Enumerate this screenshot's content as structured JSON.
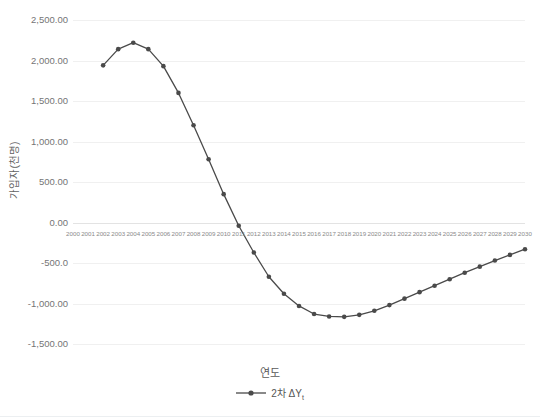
{
  "chart_data": {
    "type": "line",
    "title": "",
    "xlabel": "연도",
    "ylabel": "가입자(천명)",
    "x": [
      2000,
      2001,
      2002,
      2003,
      2004,
      2005,
      2006,
      2007,
      2008,
      2009,
      2010,
      2011,
      2012,
      2013,
      2014,
      2015,
      2016,
      2017,
      2018,
      2019,
      2020,
      2021,
      2022,
      2023,
      2024,
      2025,
      2026,
      2027,
      2028,
      2029,
      2030
    ],
    "xtick_labels": [
      "2000",
      "2001",
      "2002",
      "2003",
      "2004",
      "2005",
      "2006",
      "2007",
      "2008",
      "2009",
      "2010",
      "2011",
      "2012",
      "2013",
      "2014",
      "2015",
      "2016",
      "2017",
      "2018",
      "2019",
      "2020",
      "2021",
      "2022",
      "2023",
      "2024",
      "2025",
      "2026",
      "2027",
      "2028",
      "2029",
      "2030"
    ],
    "ytick_labels": [
      "2,500.00",
      "2,000.00",
      "1,500.00",
      "1,000.00",
      "500.00",
      "0.00",
      "-500.0",
      "-1,000.00",
      "-1,500.00"
    ],
    "ytick_values": [
      2500,
      2000,
      1500,
      1000,
      500,
      0,
      -500,
      -1000,
      -1500
    ],
    "ylim": [
      -1500,
      2500
    ],
    "xlim": [
      2000,
      2030
    ],
    "grid": true,
    "legend_position": "bottom",
    "series": [
      {
        "name": "2차 ΔY",
        "name_subscript": "t",
        "color": "#4a4a4a",
        "marker": "circle",
        "values": [
          null,
          null,
          1940,
          2140,
          2220,
          2140,
          1930,
          1600,
          1200,
          780,
          350,
          -40,
          -370,
          -670,
          -880,
          -1030,
          -1130,
          -1160,
          -1165,
          -1140,
          -1090,
          -1020,
          -940,
          -860,
          -780,
          -700,
          -620,
          -545,
          -470,
          -400,
          -330
        ]
      }
    ]
  },
  "axis": {
    "y_title": "가입자(천명)",
    "x_title": "연도"
  },
  "legend": {
    "items": [
      {
        "label_main": "2차 ΔY",
        "label_sub": "t"
      }
    ]
  }
}
